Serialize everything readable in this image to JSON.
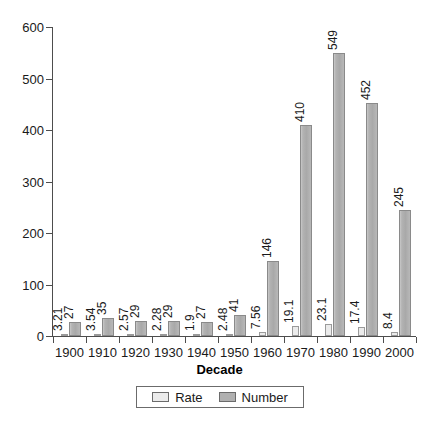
{
  "chart_data": {
    "type": "bar",
    "title": "",
    "subtitle": "",
    "xlabel": "Decade",
    "ylabel": "",
    "categories": [
      "1900",
      "1910",
      "1920",
      "1930",
      "1940",
      "1950",
      "1960",
      "1970",
      "1980",
      "1990",
      "2000"
    ],
    "series": [
      {
        "name": "Rate",
        "color": "#ebebeb",
        "values": [
          3.21,
          3.54,
          2.57,
          2.28,
          1.9,
          2.48,
          7.56,
          19.1,
          23.1,
          17.4,
          8.4
        ],
        "labels": [
          "3.21",
          "3.54",
          "2.57",
          "2.28",
          "1.9",
          "2.48",
          "7.56",
          "19.1",
          "23.1",
          "17.4",
          "8.4"
        ]
      },
      {
        "name": "Number",
        "color": "#b0b0b0",
        "values": [
          27,
          35,
          29,
          29,
          27,
          41,
          146,
          410,
          549,
          452,
          245
        ],
        "labels": [
          "27",
          "35",
          "29",
          "29",
          "27",
          "41",
          "146",
          "410",
          "549",
          "452",
          "245"
        ]
      }
    ],
    "ylim": [
      0,
      600
    ],
    "yticks": [
      0,
      100,
      200,
      300,
      400,
      500,
      600
    ],
    "ytick_labels": [
      "0",
      "100",
      "200",
      "300",
      "400",
      "500",
      "600"
    ],
    "grid": false,
    "legend_position": "bottom",
    "data_labels_rotation": -90
  },
  "legend": {
    "entries": [
      {
        "label": "Rate"
      },
      {
        "label": "Number"
      }
    ]
  },
  "axis": {
    "x_title": "Decade"
  }
}
